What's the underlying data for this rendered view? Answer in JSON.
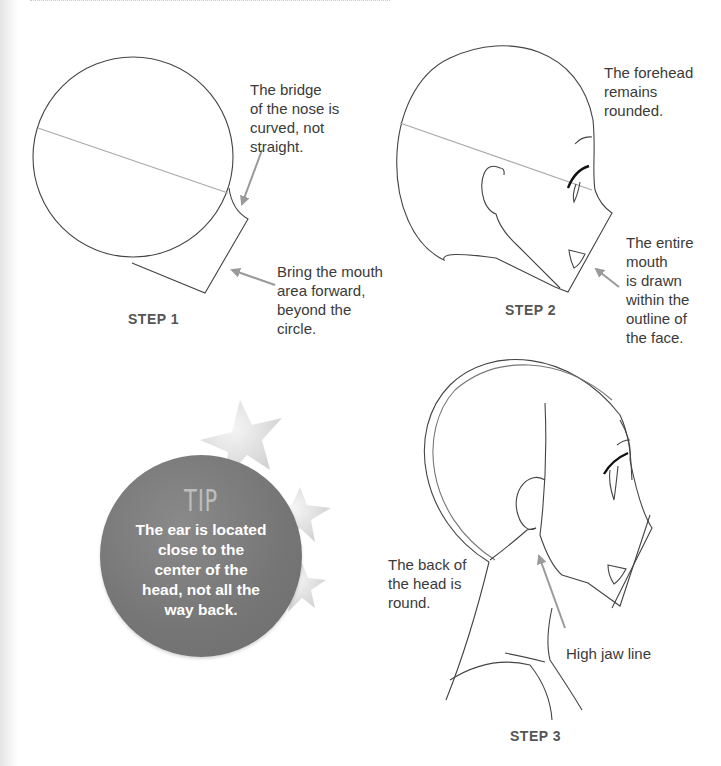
{
  "page": {
    "background": "#ffffff"
  },
  "step1": {
    "label": "STEP 1",
    "notes": [
      {
        "id": "nose-bridge",
        "text": "The bridge\nof the nose is\ncurved, not\nstraight."
      },
      {
        "id": "mouth-forward",
        "text": "Bring the mouth\narea forward,\nbeyond the\ncircle."
      }
    ]
  },
  "step2": {
    "label": "STEP 2",
    "notes": [
      {
        "id": "forehead",
        "text": "The forehead\nremains\nrounded."
      },
      {
        "id": "mouth-within",
        "text": "The entire\nmouth\nis drawn\nwithin the\noutline of\nthe face."
      }
    ]
  },
  "tip": {
    "title": "TIP",
    "text": "The ear is located\nclose to the\ncenter of the\nhead, not all the\nway back.",
    "circle_color": "#7a7a7a",
    "star_color": "#dcdcdc"
  },
  "step3": {
    "label": "STEP 3",
    "notes": [
      {
        "id": "back-of-head",
        "text": "The back of\nthe head is\nround."
      },
      {
        "id": "jaw-line",
        "text": "High jaw line"
      }
    ]
  },
  "colors": {
    "line": "#444444",
    "guide": "#a8a8a8",
    "arrow": "#9a9a9a",
    "step_label": "#555555"
  }
}
